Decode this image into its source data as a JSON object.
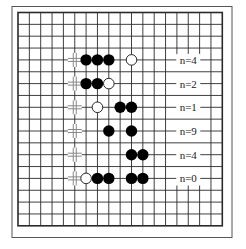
{
  "diagram": {
    "type": "go-board",
    "size": 19,
    "colors": {
      "background": "#ffffff",
      "grid": "#2a2a2a",
      "frame": "#555555",
      "black_stone": "#000000",
      "white_stone": "#ffffff",
      "marker": "#888888"
    },
    "rows": [
      {
        "row": 4,
        "label": "n=4",
        "marker_col": 5,
        "black": [
          6,
          7,
          8
        ],
        "white": [
          10
        ]
      },
      {
        "row": 6,
        "label": "n=2",
        "marker_col": 5,
        "black": [
          6,
          7
        ],
        "white": [
          8
        ]
      },
      {
        "row": 8,
        "label": "n=1",
        "marker_col": 5,
        "black": [
          9,
          10
        ],
        "white": [
          7
        ]
      },
      {
        "row": 10,
        "label": "n=9",
        "marker_col": 5,
        "black": [
          8,
          10
        ],
        "white": []
      },
      {
        "row": 12,
        "label": "n=4",
        "marker_col": 5,
        "black": [
          10,
          11
        ],
        "white": []
      },
      {
        "row": 14,
        "label": "n=0",
        "marker_col": 5,
        "black": [
          7,
          8,
          10,
          11
        ],
        "white": [
          6
        ]
      }
    ],
    "label_col": 15,
    "label_erase": {
      "col_from": 14,
      "col_to": 16,
      "row_from": 3.6,
      "row_to": 14.6
    }
  }
}
